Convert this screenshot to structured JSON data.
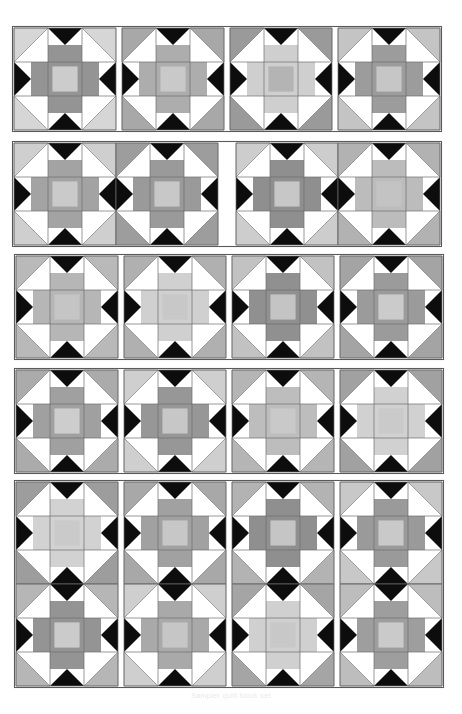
{
  "page": {
    "background_color": "#ffffff",
    "width": 462,
    "height": 714,
    "caption": "Sampler quilt block set"
  },
  "palette": {
    "white": "#ffffff",
    "black": "#0d0d0d",
    "light_gray": "#d2d2d2",
    "mid_light_gray": "#bdbdbd",
    "mid_gray": "#a6a6a6",
    "dark_gray": "#8a8a8a",
    "outline": "#5a5a5a",
    "grid_line": "#6e6e6e"
  },
  "block_motif": {
    "name": "star-cross-block",
    "grid": "3x3",
    "cells": [
      {
        "position": "top-left",
        "shape": "corner-triangle",
        "corner": "tl"
      },
      {
        "position": "top-center",
        "shape": "down-point-triangle-over-bar"
      },
      {
        "position": "top-right",
        "shape": "corner-triangle",
        "corner": "tr"
      },
      {
        "position": "middle-left",
        "shape": "left-point-triangle-over-bar"
      },
      {
        "position": "center",
        "shape": "square-in-square"
      },
      {
        "position": "middle-right",
        "shape": "right-point-triangle-over-bar"
      },
      {
        "position": "bottom-left",
        "shape": "corner-triangle",
        "corner": "bl"
      },
      {
        "position": "bottom-center",
        "shape": "up-point-triangle-over-bar"
      },
      {
        "position": "bottom-right",
        "shape": "corner-triangle",
        "corner": "br"
      }
    ]
  },
  "strips": [
    {
      "id": "strip-1",
      "label": "Row 1 — four single blocks",
      "x": 14,
      "y": 28,
      "cols": 3,
      "rows": 3,
      "cell": 34,
      "gap": 2,
      "blocks": [
        {
          "index": 0,
          "x": 14,
          "y": 28,
          "corner": "#d6d6d6",
          "arm": "#949494",
          "center": "#cccccc"
        },
        {
          "index": 1,
          "x": 122,
          "y": 28,
          "corner": "#a8a8a8",
          "arm": "#adadad",
          "center": "#c9c9c9"
        },
        {
          "index": 2,
          "x": 230,
          "y": 28,
          "corner": "#9a9a9a",
          "arm": "#cfcfcf",
          "center": "#b4b4b4"
        },
        {
          "index": 3,
          "x": 338,
          "y": 28,
          "corner": "#c4c4c4",
          "arm": "#9c9c9c",
          "center": "#c6c6c6"
        }
      ]
    },
    {
      "id": "strip-2",
      "label": "Row 2 — two joined pairs",
      "x": 14,
      "y": 143,
      "cell": 34,
      "blocks": [
        {
          "index": 0,
          "x": 14,
          "y": 143,
          "corner": "#cfcfcf",
          "arm": "#a3a3a3",
          "center": "#cacaca"
        },
        {
          "index": 1,
          "x": 116,
          "y": 143,
          "corner": "#9d9d9d",
          "arm": "#9a9a9a",
          "center": "#c8c8c8"
        },
        {
          "index": 2,
          "x": 236,
          "y": 143,
          "corner": "#cdcdcd",
          "arm": "#8f8f8f",
          "center": "#c7c7c7"
        },
        {
          "index": 3,
          "x": 338,
          "y": 143,
          "corner": "#b2b2b2",
          "arm": "#bcbcbc",
          "center": "#c3c3c3"
        }
      ]
    },
    {
      "id": "strip-3",
      "label": "Row 3 — four joined blocks",
      "x": 14,
      "y": 256,
      "cell": 34,
      "blocks": [
        {
          "index": 0,
          "x": 16,
          "y": 256,
          "corner": "#b9b9b9",
          "arm": "#b6b6b6",
          "center": "#c5c5c5"
        },
        {
          "index": 1,
          "x": 124,
          "y": 256,
          "corner": "#b0b0b0",
          "arm": "#d0d0d0",
          "center": "#c8c8c8"
        },
        {
          "index": 2,
          "x": 232,
          "y": 256,
          "corner": "#c2c2c2",
          "arm": "#909090",
          "center": "#c4c4c4"
        },
        {
          "index": 3,
          "x": 340,
          "y": 256,
          "corner": "#a4a4a4",
          "arm": "#9b9b9b",
          "center": "#cbcbcb"
        }
      ]
    },
    {
      "id": "strip-4",
      "label": "Row 4 — four joined blocks",
      "x": 14,
      "y": 370,
      "cell": 34,
      "blocks": [
        {
          "index": 0,
          "x": 16,
          "y": 370,
          "corner": "#ababab",
          "arm": "#a0a0a0",
          "center": "#cdcdcd"
        },
        {
          "index": 1,
          "x": 124,
          "y": 370,
          "corner": "#cfcfcf",
          "arm": "#979797",
          "center": "#c7c7c7"
        },
        {
          "index": 2,
          "x": 232,
          "y": 370,
          "corner": "#b5b5b5",
          "arm": "#bdbdbd",
          "center": "#c9c9c9"
        },
        {
          "index": 3,
          "x": 340,
          "y": 370,
          "corner": "#a1a1a1",
          "arm": "#d1d1d1",
          "center": "#cacaca"
        }
      ]
    },
    {
      "id": "strip-5",
      "label": "Row 5 — four by two block field",
      "x": 14,
      "y": 482,
      "cell": 34,
      "blocks": [
        {
          "index": 0,
          "x": 16,
          "y": 482,
          "corner": "#9d9d9d",
          "arm": "#d2d2d2",
          "center": "#cacaca"
        },
        {
          "index": 1,
          "x": 124,
          "y": 482,
          "corner": "#a8a8a8",
          "arm": "#a1a1a1",
          "center": "#c7c7c7"
        },
        {
          "index": 2,
          "x": 232,
          "y": 482,
          "corner": "#b3b3b3",
          "arm": "#8f8f8f",
          "center": "#c5c5c5"
        },
        {
          "index": 3,
          "x": 340,
          "y": 482,
          "corner": "#c8c8c8",
          "arm": "#9a9a9a",
          "center": "#c9c9c9"
        },
        {
          "index": 4,
          "x": 16,
          "y": 584,
          "corner": "#b6b6b6",
          "arm": "#949494",
          "center": "#cbcbcb"
        },
        {
          "index": 5,
          "x": 124,
          "y": 584,
          "corner": "#cfcfcf",
          "arm": "#a9a9a9",
          "center": "#c6c6c6"
        },
        {
          "index": 6,
          "x": 232,
          "y": 584,
          "corner": "#a5a5a5",
          "arm": "#d0d0d0",
          "center": "#c8c8c8"
        },
        {
          "index": 7,
          "x": 340,
          "y": 584,
          "corner": "#bdbdbd",
          "arm": "#9e9e9e",
          "center": "#cacaca"
        }
      ]
    }
  ]
}
